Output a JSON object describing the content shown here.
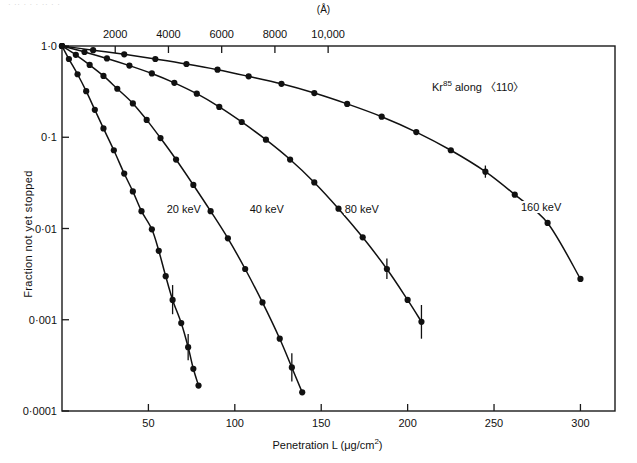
{
  "figure": {
    "ghost_text": "· ·· ·   ·    ·        ·· ·      ·",
    "annotation": "Kr",
    "annotation_sup": "85",
    "annotation_tail": " along 〈110〉"
  },
  "chart_data": {
    "type": "line",
    "title": "",
    "xlabel": "Penetration L  (μg/cm",
    "xlabel_sup": "2",
    "xlabel_tail": ")",
    "ylabel": "Fraction not yet stopped",
    "top_axis_label": "(Å)",
    "xlim": [
      0,
      320
    ],
    "ylim": [
      0.0001,
      1.0
    ],
    "yscale": "log",
    "grid": false,
    "legend_position": "inline-curve-labels",
    "xticks": [
      50,
      100,
      150,
      200,
      250,
      300
    ],
    "xticklabels": [
      "50",
      "100",
      "150",
      "200",
      "250",
      "300"
    ],
    "yticks": [
      1.0,
      0.1,
      0.01,
      0.001,
      0.0001
    ],
    "yticklabels": [
      "1·0",
      "0·1",
      "0·01",
      "0·001",
      "0·0001"
    ],
    "top_xticks": [
      2000,
      4000,
      6000,
      8000,
      10000
    ],
    "top_xticklabels": [
      "2000",
      "4000",
      "6000",
      "8000",
      "10,000"
    ],
    "top_axis_scale_note": "Angstrom depth axis, ~2000 Å per 30.8 μg/cm²",
    "series": [
      {
        "name": "20 keV",
        "label": "20 keV",
        "label_x": 60,
        "label_y": 0.0155,
        "x": [
          0,
          4,
          9,
          14,
          19,
          24,
          30,
          36,
          41,
          46,
          52,
          56,
          60,
          64,
          69,
          73,
          76,
          79
        ],
        "y": [
          1.0,
          0.72,
          0.49,
          0.32,
          0.2,
          0.125,
          0.072,
          0.04,
          0.0255,
          0.0155,
          0.0098,
          0.0057,
          0.003,
          0.00165,
          0.00092,
          0.0005,
          0.00029,
          0.00019
        ]
      },
      {
        "name": "40 keV",
        "label": "40 keV",
        "label_x": 108,
        "label_y": 0.0155,
        "x": [
          0,
          8,
          16,
          24,
          32,
          41,
          49,
          57,
          66,
          76,
          86,
          96,
          106,
          116,
          126,
          133,
          139
        ],
        "y": [
          1.0,
          0.8,
          0.62,
          0.47,
          0.34,
          0.235,
          0.155,
          0.098,
          0.057,
          0.03,
          0.0155,
          0.0078,
          0.0036,
          0.00155,
          0.00062,
          0.0003,
          0.00016
        ]
      },
      {
        "name": "80 keV",
        "label": "80 keV",
        "label_x": 163,
        "label_y": 0.0155,
        "x": [
          0,
          13,
          26,
          39,
          52,
          65,
          78,
          91,
          104,
          118,
          132,
          146,
          160,
          174,
          188,
          200,
          208
        ],
        "y": [
          1.0,
          0.86,
          0.73,
          0.61,
          0.5,
          0.395,
          0.3,
          0.215,
          0.147,
          0.094,
          0.057,
          0.032,
          0.0165,
          0.008,
          0.0036,
          0.00165,
          0.00095
        ]
      },
      {
        "name": "160 keV",
        "label": "160 keV",
        "label_x": 265,
        "label_y": 0.0165,
        "x": [
          0,
          18,
          36,
          54,
          72,
          90,
          108,
          127,
          146,
          165,
          185,
          205,
          225,
          245,
          262,
          281,
          300
        ],
        "y": [
          1.0,
          0.9,
          0.81,
          0.72,
          0.635,
          0.55,
          0.465,
          0.385,
          0.305,
          0.232,
          0.168,
          0.114,
          0.072,
          0.042,
          0.0235,
          0.0115,
          0.0028
        ]
      }
    ],
    "error_bars": [
      {
        "series": "20 keV",
        "x": 64,
        "y": 0.00165,
        "ylow": 0.00115,
        "yhigh": 0.0024
      },
      {
        "series": "20 keV",
        "x": 73,
        "y": 0.0005,
        "ylow": 0.00036,
        "yhigh": 0.0007
      },
      {
        "series": "40 keV",
        "x": 133,
        "y": 0.0003,
        "ylow": 0.00021,
        "yhigh": 0.00043
      },
      {
        "series": "80 keV",
        "x": 188,
        "y": 0.0036,
        "ylow": 0.0028,
        "yhigh": 0.0047
      },
      {
        "series": "80 keV",
        "x": 208,
        "y": 0.00095,
        "ylow": 0.00062,
        "yhigh": 0.00145
      },
      {
        "series": "160 keV",
        "x": 245,
        "y": 0.042,
        "ylow": 0.036,
        "yhigh": 0.049
      }
    ]
  }
}
